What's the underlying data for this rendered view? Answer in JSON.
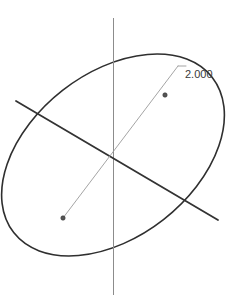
{
  "canvas": {
    "width": 229,
    "height": 302,
    "background_color": "#ffffff",
    "title": "Ellipse sketch with radial dimension"
  },
  "colors": {
    "ellipse_outline": "#2f2f2f",
    "major_axis": "#333333",
    "construction_axis": "#8c8c8c",
    "dimension_line": "#9a9a9a",
    "dimension_text": "#3a3a3a",
    "background": "#ffffff"
  },
  "dimension": {
    "value_label": "2.000",
    "text_x": 185,
    "text_y": 68,
    "leader": {
      "shelf_start_x": 178,
      "shelf_start_y": 66,
      "shelf_end_x": 186,
      "shelf_end_y": 66
    },
    "extent_start": {
      "x": 63,
      "y": 218
    },
    "extent_end": {
      "x": 178,
      "y": 66
    },
    "arrow_tail": {
      "x": 63,
      "y": 218
    },
    "arrow_head": {
      "x": 165,
      "y": 95
    }
  },
  "geometry": {
    "ellipse": {
      "center_x": 113,
      "center_y": 155,
      "semi_major": 126,
      "semi_minor": 82,
      "rotation_deg": -38,
      "stroke_width": 1.6
    },
    "major_axis_chord": {
      "x1": 16,
      "y1": 101,
      "x2": 218,
      "y2": 220,
      "stroke_width": 1.8
    },
    "construction_axis": {
      "x1": 113.5,
      "y1": 18,
      "x2": 113.5,
      "y2": 295,
      "stroke_width": 1.0
    },
    "diagonal_dimension_line": {
      "x1": 63,
      "y1": 218,
      "x2": 178,
      "y2": 66,
      "stroke_width": 0.9
    }
  },
  "markers": {
    "point_upper_right": {
      "x": 165,
      "y": 95,
      "radius": 2.2
    },
    "point_lower_left": {
      "x": 63,
      "y": 218,
      "radius": 2.2
    }
  }
}
